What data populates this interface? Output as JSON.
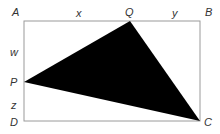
{
  "diagram": {
    "type": "geometry",
    "colors": {
      "rectangle_stroke": "#9a9a9a",
      "triangle_fill": "#000000",
      "label": "#333333"
    },
    "points": {
      "A": {
        "label": "A",
        "x": 24,
        "y": 21
      },
      "B": {
        "label": "B",
        "x": 200,
        "y": 21
      },
      "C": {
        "label": "C",
        "x": 200,
        "y": 121
      },
      "D": {
        "label": "D",
        "x": 24,
        "y": 121
      },
      "P": {
        "label": "P",
        "x": 24,
        "y": 82
      },
      "Q": {
        "label": "Q",
        "x": 130,
        "y": 21
      }
    },
    "segment_labels": {
      "x": "x",
      "y": "y",
      "w": "w",
      "z": "z"
    },
    "shaded_region": "triangle PQC"
  }
}
